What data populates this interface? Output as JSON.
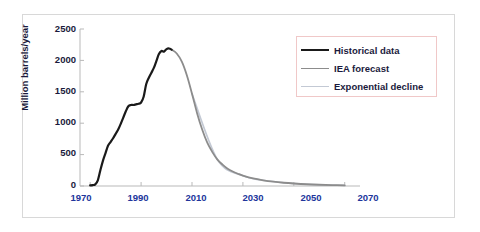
{
  "chart_data": {
    "type": "line",
    "title": "",
    "xlabel": "",
    "ylabel": "Million barrels/year",
    "xlim": [
      1966,
      2076
    ],
    "ylim": [
      0,
      2500
    ],
    "xticks": [
      1970,
      1990,
      2010,
      2030,
      2050,
      2070
    ],
    "yticks": [
      0,
      500,
      1000,
      1500,
      2000,
      2500
    ],
    "grid": false,
    "legend_position": "upper right",
    "series": [
      {
        "name": "Historical data",
        "color": "#1a1a1a",
        "x": [
          1970,
          1971,
          1972,
          1973,
          1974,
          1975,
          1976,
          1977,
          1978,
          1979,
          1980,
          1981,
          1982,
          1983,
          1984,
          1985,
          1986,
          1987,
          1988,
          1989,
          1990,
          1991,
          1992,
          1993,
          1994,
          1995,
          1996,
          1997,
          1998,
          1999,
          2000,
          2001,
          2002
        ],
        "y": [
          10,
          15,
          25,
          90,
          250,
          400,
          520,
          640,
          700,
          760,
          830,
          900,
          990,
          1090,
          1190,
          1270,
          1290,
          1290,
          1300,
          1310,
          1330,
          1420,
          1620,
          1720,
          1800,
          1880,
          1990,
          2100,
          2150,
          2140,
          2180,
          2190,
          2170
        ]
      },
      {
        "name": "IEA forecast",
        "color": "#8c8c8c",
        "x": [
          2002,
          2004,
          2006,
          2008,
          2010,
          2012,
          2014,
          2016,
          2018,
          2020,
          2022,
          2024,
          2026,
          2028,
          2030,
          2034,
          2038,
          2042,
          2046,
          2050,
          2055,
          2060,
          2065,
          2070
        ],
        "y": [
          2170,
          2110,
          1980,
          1760,
          1470,
          1160,
          900,
          690,
          540,
          420,
          340,
          275,
          230,
          195,
          165,
          120,
          90,
          68,
          52,
          40,
          28,
          20,
          14,
          10
        ]
      },
      {
        "name": "Exponential decline",
        "color": "#c3c9d4",
        "x": [
          2010,
          2020,
          2030,
          2040,
          2050,
          2060,
          2070
        ],
        "y": [
          1470,
          420,
          165,
          80,
          40,
          20,
          10
        ]
      }
    ]
  },
  "axis": {
    "y_title": "Million barrels/year",
    "y_ticks": [
      "2500",
      "2000",
      "1500",
      "1000",
      "500",
      "0"
    ],
    "x_ticks": [
      "1970",
      "1990",
      "2010",
      "2030",
      "2050",
      "2070"
    ]
  },
  "legend": {
    "items": [
      {
        "label": "Historical data",
        "color": "#1a1a1a",
        "width": "2.2px"
      },
      {
        "label": "IEA forecast",
        "color": "#8c8c8c",
        "width": "1.8px"
      },
      {
        "label": "Exponential decline",
        "color": "#c3c9d4",
        "width": "1.6px"
      }
    ]
  }
}
